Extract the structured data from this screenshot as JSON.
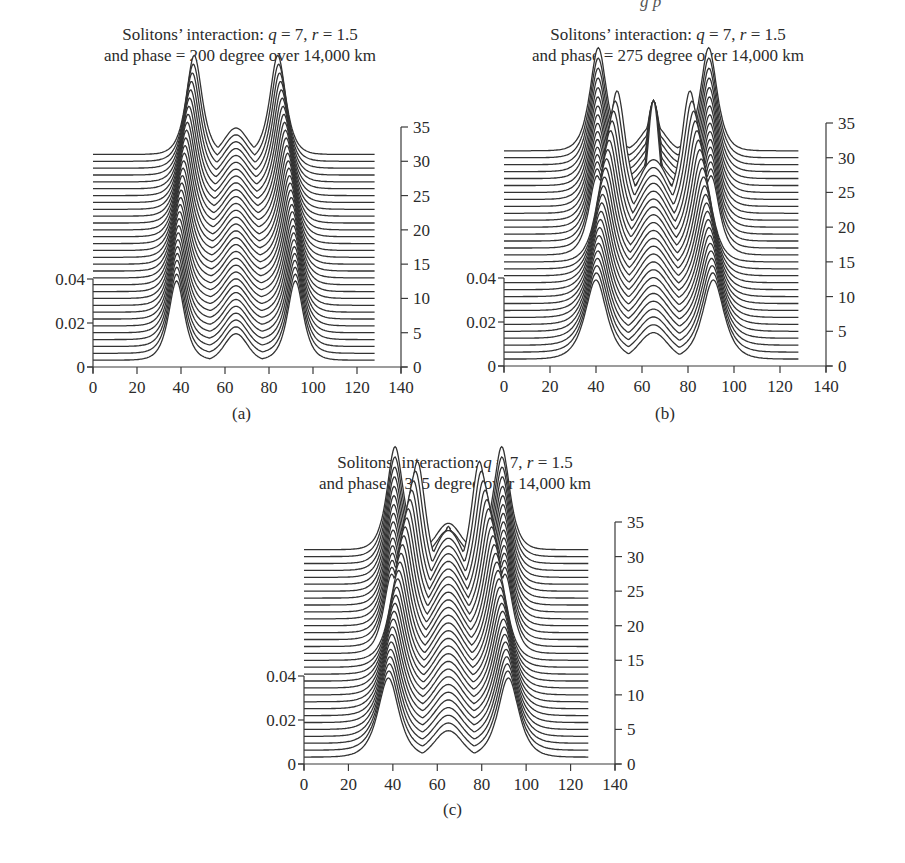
{
  "header_fragment": "g   p",
  "chart_data": [
    {
      "id": "a",
      "type": "line",
      "subtype": "waterfall",
      "panel_label": "(a)",
      "title_line1_prefix": "Solitons’ interaction: ",
      "q_symbol": "q",
      "q_value": " = 7, ",
      "r_symbol": "r",
      "r_value": " = 1.5",
      "title_line2": "and phase = 200 degree over 14,000 km",
      "x_ticks": [
        0,
        20,
        40,
        60,
        80,
        100,
        120,
        140
      ],
      "xlim": [
        0,
        140
      ],
      "left_y_ticks": [
        "0",
        "0.02",
        "0.04"
      ],
      "left_ylim": [
        0,
        0.04
      ],
      "right_y_ticks": [
        0,
        5,
        10,
        15,
        20,
        25,
        30,
        35
      ],
      "right_ylim": [
        0,
        35
      ],
      "trace_x_range": [
        0,
        128
      ],
      "trace_count": 31,
      "trace_offsets": [
        1,
        31
      ],
      "model": {
        "center_peak": {
          "x": 65,
          "height": 0.012,
          "width": 5
        },
        "side_start": [
          38,
          92
        ],
        "side_end": [
          46,
          84
        ],
        "side_height_start": 0.036,
        "side_height_end": 0.036,
        "side_width": 3.2,
        "collision": false
      }
    },
    {
      "id": "b",
      "type": "line",
      "subtype": "waterfall",
      "panel_label": "(b)",
      "title_line1_prefix": "Solitons’ interaction: ",
      "q_symbol": "q",
      "q_value": " = 7, ",
      "r_symbol": "r",
      "r_value": " = 1.5",
      "title_line2": "and phase = 275 degree over 14,000 km",
      "x_ticks": [
        0,
        20,
        40,
        60,
        80,
        100,
        120,
        140
      ],
      "xlim": [
        0,
        140
      ],
      "left_y_ticks": [
        "0",
        "0.02",
        "0.04"
      ],
      "left_ylim": [
        0,
        0.04
      ],
      "right_y_ticks": [
        0,
        5,
        10,
        15,
        20,
        25,
        30,
        35
      ],
      "right_ylim": [
        0,
        35
      ],
      "trace_x_range": [
        0,
        128
      ],
      "trace_count": 31,
      "trace_offsets": [
        1,
        31
      ],
      "model": {
        "center_peak": {
          "x": 65,
          "height": 0.012,
          "width": 5
        },
        "side_start": [
          40,
          91
        ],
        "side_end": [
          41,
          89
        ],
        "side_height_start": 0.036,
        "side_height_end": 0.036,
        "side_width": 3.2,
        "collision": true,
        "collision_center_trace": 23,
        "collision_inner": [
          50,
          80
        ],
        "collision_center_height": 0.045
      }
    },
    {
      "id": "c",
      "type": "line",
      "subtype": "waterfall",
      "panel_label": "(c)",
      "title_line1_prefix": "Solitons’ interaction: ",
      "q_symbol": "q",
      "q_value": " = 7, ",
      "r_symbol": "r",
      "r_value": " = 1.5",
      "title_line2": "and phase = 315 degree over 14,000 km",
      "x_ticks": [
        0,
        20,
        40,
        60,
        80,
        100,
        120,
        140
      ],
      "xlim": [
        0,
        140
      ],
      "left_y_ticks": [
        "0",
        "0.02",
        "0.04"
      ],
      "left_ylim": [
        0,
        0.04
      ],
      "right_y_ticks": [
        0,
        5,
        10,
        15,
        20,
        25,
        30,
        35
      ],
      "right_ylim": [
        0,
        35
      ],
      "trace_x_range": [
        0,
        128
      ],
      "trace_count": 31,
      "trace_offsets": [
        1,
        31
      ],
      "model": {
        "center_peak": {
          "x": 65,
          "height": 0.012,
          "width": 5
        },
        "side_start": [
          38,
          92
        ],
        "side_end": [
          41,
          89
        ],
        "side_height_start": 0.036,
        "side_height_end": 0.036,
        "side_width": 3.2,
        "collision": true,
        "collision_center_trace": 27,
        "collision_inner": [
          52,
          78
        ],
        "collision_center_height": 0.02
      }
    }
  ]
}
